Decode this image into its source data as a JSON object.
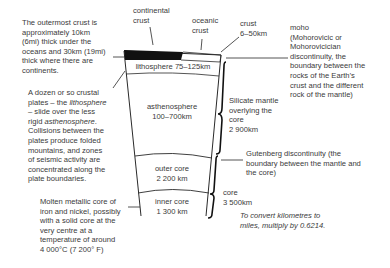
{
  "diagram": {
    "labels": {
      "continental_crust": "continental\ncrust",
      "oceanic_crust": "oceanic\ncrust",
      "crust": "crust\n6–50km",
      "moho": "moho\n(Mohorovicic or\nMohorovicician\ndiscontinuity, the\nboundary between the\nrocks of the Earth’s\ncrust and the different\nrock of the mantle)",
      "outer_crust_note": "The outermost crust is\napproximately 10km\n(6mi) thick under the\noceans and 30km (19mi)\nthick where there are\ncontinents.",
      "plates_note_1": "A dozen or so crustal\nplates – the ",
      "plates_note_lith": "lithosphere",
      "plates_note_2": "– slide over the less\nrigid ",
      "plates_note_asth": "asthenosphere",
      "plates_note_3": ".\nCollisions between the\nplates produce folded\nmountains, and zones\nof seismic activity are\nconcentrated along the\nplate boundaries.",
      "core_note": "Molten metallic core of\niron and nickel, possibly\nwith a solid core at the\nvery centre at a\ntemperature of around\n4 000°C (7 200° F)",
      "lithosphere": "lithosphere 75–125km",
      "asthenosphere": "asthenosphere\n100–700km",
      "outer_core": "outer core\n2 200 km",
      "inner_core": "inner core\n1 300 km",
      "silicate_mantle": "Silicate mantle\noverlying the\ncore\n2 900km",
      "gutenberg": "Gutenberg discontinuity (the\nboundary between the mantle and\nthe core)",
      "core": "core\n3 500km",
      "conversion": "To convert kilometres to\nmiles, multiply by 0.6214."
    },
    "colors": {
      "line": "#2a2a2a",
      "crust_fill": "#111111",
      "text": "#3a3a3a"
    }
  }
}
